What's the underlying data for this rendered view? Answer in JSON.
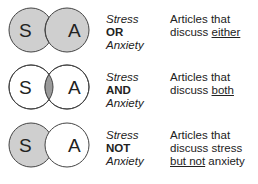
{
  "colors": {
    "shade": "#cfcfcf",
    "intersection": "#9a9a9a",
    "stroke": "#444444",
    "background": "#ffffff"
  },
  "rows": [
    {
      "operator": "OR",
      "left_circle_label": "S",
      "right_circle_label": "A",
      "term1": "Stress",
      "term2": "Anxiety",
      "shading": "union",
      "description": {
        "line1": "Articles that",
        "line2_pre": "discuss ",
        "line2_underlined": "either",
        "line2_post": "",
        "line3_underlined": "",
        "line3_post": ""
      }
    },
    {
      "operator": "AND",
      "left_circle_label": "S",
      "right_circle_label": "A",
      "term1": "Stress",
      "term2": "Anxiety",
      "shading": "intersection",
      "description": {
        "line1": "Articles that",
        "line2_pre": "discuss ",
        "line2_underlined": "both",
        "line2_post": "",
        "line3_underlined": "",
        "line3_post": ""
      }
    },
    {
      "operator": "NOT",
      "left_circle_label": "S",
      "right_circle_label": "A",
      "term1": "Stress",
      "term2": "Anxiety",
      "shading": "left-only",
      "description": {
        "line1": "Articles that",
        "line2_pre": "discuss stress",
        "line2_underlined": "",
        "line2_post": "",
        "line3_underlined": "but not",
        "line3_post": " anxiety"
      }
    }
  ]
}
